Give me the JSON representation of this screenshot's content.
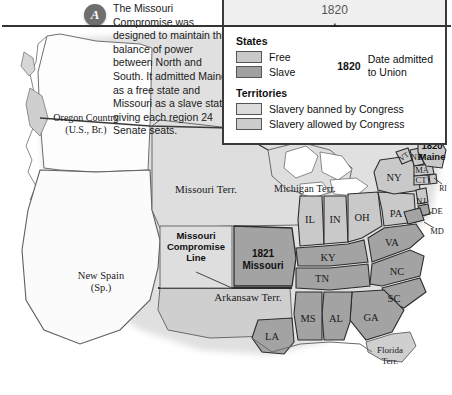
{
  "timeline": {
    "year": "1820",
    "star_icon": "star-icon"
  },
  "annotation": {
    "marker_letter": "A",
    "text": "The Missouri Compromise was designed to maintain the balance of power between North and South. It admitted Maine as a free state and Missouri as a slave state, giving each region 24 Senate seats."
  },
  "legend": {
    "title": "1820",
    "states_heading": "States",
    "territories_heading": "Territories",
    "entries": [
      {
        "label": "Free",
        "color": "#c9c9c9"
      },
      {
        "label": "Slave",
        "color": "#a0a0a0"
      },
      {
        "label": "Slavery banned by Congress",
        "color": "#dcdcdc"
      },
      {
        "label": "Slavery allowed by Congress",
        "color": "#cccccc"
      }
    ],
    "date_year": "1820",
    "date_note_line1": "Date admitted",
    "date_note_line2": "to Union"
  },
  "map": {
    "colors": {
      "free_state": "#c9c9c9",
      "slave_state": "#a3a3a3",
      "territory_banned": "#dedede",
      "territory_allowed": "#cfcfcf",
      "unorganized": "#ececec",
      "water": "#ffffff",
      "border": "#3a3a3a"
    },
    "territories": [
      {
        "name": "Oregon Country",
        "sub": "(U.S., Br.)"
      },
      {
        "name": "Missouri Terr.",
        "sub": ""
      },
      {
        "name": "Michigan Terr.",
        "sub": ""
      },
      {
        "name": "Arkansaw Terr.",
        "sub": ""
      },
      {
        "name": "New Spain",
        "sub": "(Sp.)"
      },
      {
        "name": "Florida",
        "sub": "Terr."
      }
    ],
    "compromise_line_label_line1": "Missouri",
    "compromise_line_label_line2": "Compromise",
    "compromise_line_label_line3": "Line",
    "missouri_year": "1821",
    "missouri_name": "Missouri",
    "maine_year": "1820",
    "maine_name": "Maine",
    "states": [
      {
        "abbr": "IL",
        "type": "free"
      },
      {
        "abbr": "IN",
        "type": "free"
      },
      {
        "abbr": "OH",
        "type": "free"
      },
      {
        "abbr": "PA",
        "type": "free"
      },
      {
        "abbr": "NY",
        "type": "free"
      },
      {
        "abbr": "VT",
        "type": "free"
      },
      {
        "abbr": "NH",
        "type": "free"
      },
      {
        "abbr": "MA",
        "type": "free"
      },
      {
        "abbr": "CT",
        "type": "free"
      },
      {
        "abbr": "RI",
        "type": "free"
      },
      {
        "abbr": "NJ",
        "type": "free"
      },
      {
        "abbr": "DE",
        "type": "slave"
      },
      {
        "abbr": "MD",
        "type": "slave"
      },
      {
        "abbr": "VA",
        "type": "slave"
      },
      {
        "abbr": "NC",
        "type": "slave"
      },
      {
        "abbr": "SC",
        "type": "slave"
      },
      {
        "abbr": "GA",
        "type": "slave"
      },
      {
        "abbr": "KY",
        "type": "slave"
      },
      {
        "abbr": "TN",
        "type": "slave"
      },
      {
        "abbr": "AL",
        "type": "slave"
      },
      {
        "abbr": "MS",
        "type": "slave"
      },
      {
        "abbr": "LA",
        "type": "slave"
      }
    ]
  }
}
